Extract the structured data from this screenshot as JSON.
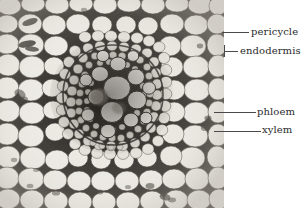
{
  "figure": {
    "kind": "light-micrograph",
    "background_color": "#ffffff",
    "plate": {
      "x": 0,
      "y": 0,
      "width": 224,
      "height": 208,
      "tone_light": "#f2f0ec",
      "tone_mid": "#9a9791",
      "tone_dark": "#1a1714"
    }
  },
  "labels": [
    {
      "id": "pericycle",
      "text": "pericycle",
      "text_x": 251,
      "text_y": 27,
      "leader_x": 222,
      "leader_y": 32,
      "leader_width": 27,
      "tick": false
    },
    {
      "id": "endodermis",
      "text": "endodermis",
      "text_x": 240,
      "text_y": 46,
      "leader_x": 224,
      "leader_y": 51,
      "leader_width": 14,
      "tick": true,
      "tick_x": 224,
      "tick_y": 45,
      "tick_height": 12
    },
    {
      "id": "phloem",
      "text": "phloem",
      "text_x": 257,
      "text_y": 107,
      "leader_x": 214,
      "leader_y": 112,
      "leader_width": 42,
      "tick": false
    },
    {
      "id": "xylem",
      "text": "xylem",
      "text_x": 262,
      "text_y": 125,
      "leader_x": 214,
      "leader_y": 131,
      "leader_width": 47,
      "tick": false
    }
  ],
  "colors": {
    "leader_line": "#4a4a4a",
    "label_text": "#2b2b2b",
    "page_background": "#ffffff"
  }
}
